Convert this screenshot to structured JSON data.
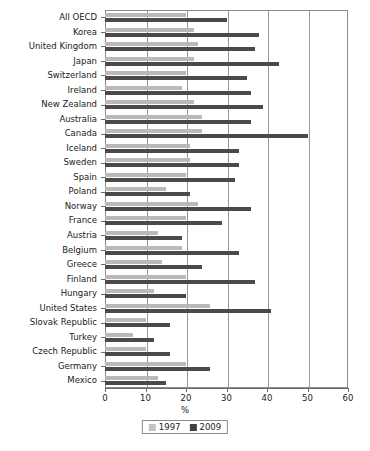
{
  "chart_data": {
    "type": "bar",
    "orientation": "horizontal",
    "title": "",
    "xlabel": "%",
    "ylabel": "",
    "xlim": [
      0,
      60
    ],
    "xticks": [
      0,
      10,
      20,
      30,
      40,
      50,
      60
    ],
    "grid": true,
    "legend_position": "bottom",
    "categories": [
      "All OECD",
      "Korea",
      "United Kingdom",
      "Japan",
      "Switzerland",
      "Ireland",
      "New Zealand",
      "Australia",
      "Canada",
      "Iceland",
      "Sweden",
      "Spain",
      "Poland",
      "Norway",
      "France",
      "Austria",
      "Belgium",
      "Greece",
      "Finland",
      "Hungary",
      "United States",
      "Slovak Republic",
      "Turkey",
      "Czech Republic",
      "Germany",
      "Mexico"
    ],
    "series": [
      {
        "name": "1997",
        "color": "#b9b9b9",
        "values": [
          20,
          22,
          23,
          22,
          20,
          19,
          22,
          24,
          24,
          21,
          21,
          20,
          15,
          23,
          20,
          13,
          19,
          14,
          20,
          12,
          26,
          10,
          7,
          10,
          20,
          13
        ]
      },
      {
        "name": "2009",
        "color": "#4a4a4a",
        "values": [
          30,
          38,
          37,
          43,
          35,
          36,
          39,
          36,
          50,
          33,
          33,
          32,
          21,
          36,
          29,
          19,
          33,
          24,
          37,
          20,
          41,
          16,
          12,
          16,
          26,
          15
        ]
      }
    ]
  },
  "legend": {
    "items": [
      {
        "label": "1997",
        "color": "#c4c4c4"
      },
      {
        "label": "2009",
        "color": "#3f3f3f"
      }
    ]
  },
  "axis": {
    "x_title": "%"
  }
}
